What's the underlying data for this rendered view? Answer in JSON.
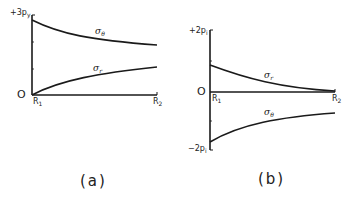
{
  "panels": [
    {
      "id": "a",
      "caption": "(a)",
      "y_top_label": "+3p",
      "y_top_sub": "y",
      "origin_label": "O",
      "x_start_label": "R",
      "x_start_sub": "1",
      "x_end_label": "R",
      "x_end_sub": "2",
      "curves": [
        {
          "name": "σ",
          "sub": "θ",
          "description": "hoop stress, decreasing from +3p_y at R1"
        },
        {
          "name": "σ",
          "sub": "r",
          "description": "radial stress, increasing from 0 at R1"
        }
      ]
    },
    {
      "id": "b",
      "caption": "(b)",
      "y_top_label": "+2p",
      "y_top_sub": "i",
      "y_bottom_label": "−2p",
      "y_bottom_sub": "i",
      "origin_label": "O",
      "x_start_label": "R",
      "x_start_sub": "1",
      "x_end_label": "R",
      "x_end_sub": "2",
      "curves": [
        {
          "name": "σ",
          "sub": "r",
          "description": "radial stress, positive at R1 decaying to 0 at R2"
        },
        {
          "name": "σ",
          "sub": "θ",
          "description": "hoop stress, −2p_i at R1 rising toward 0"
        }
      ]
    }
  ],
  "colors": {
    "line": "#1a1a1a",
    "background": "#ffffff"
  }
}
